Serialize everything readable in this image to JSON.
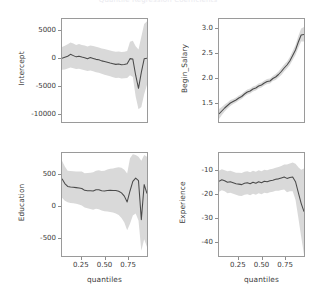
{
  "figure": {
    "title": "Quantile Regression Coefficients",
    "width": 316,
    "height": 295,
    "background": "#ffffff",
    "line_color": "#4a4a4a",
    "band_color": "#d9d9d9",
    "frame_color": "#9a9a9a",
    "text_color": "#3b3b3b"
  },
  "axis": {
    "xlabel": "quantiles",
    "xticks": [
      "0.25",
      "0.50",
      "0.75"
    ]
  },
  "chart_data": [
    {
      "type": "line",
      "id": "intercept",
      "title": "",
      "xlabel": "",
      "ylabel": "Intercept",
      "grid": false,
      "legend": "none",
      "xlim": [
        0.05,
        0.95
      ],
      "ylim": [
        -11500,
        7000
      ],
      "yticks": [
        5000,
        0,
        -5000,
        -10000
      ],
      "ytick_labels": [
        "5000",
        "0",
        "-5000",
        "-10000"
      ],
      "xticks": [
        0.25,
        0.5,
        0.75
      ],
      "xtick_labels": [
        "0.25",
        "0.50",
        "0.75"
      ],
      "x": [
        0.05,
        0.08,
        0.11,
        0.14,
        0.17,
        0.2,
        0.23,
        0.26,
        0.29,
        0.32,
        0.35,
        0.38,
        0.41,
        0.44,
        0.47,
        0.5,
        0.53,
        0.56,
        0.59,
        0.62,
        0.65,
        0.68,
        0.71,
        0.74,
        0.77,
        0.8,
        0.83,
        0.86,
        0.89,
        0.92,
        0.95
      ],
      "series": [
        {
          "name": "coefficient",
          "values": [
            -50,
            120,
            300,
            650,
            420,
            200,
            330,
            180,
            60,
            -120,
            80,
            -80,
            -250,
            -320,
            -520,
            -640,
            -760,
            -900,
            -1020,
            -1150,
            -1080,
            -1220,
            -1160,
            -1050,
            -120,
            -200,
            -3100,
            -5450,
            -2600,
            -150,
            -60
          ]
        },
        {
          "name": "ci_lower",
          "values": [
            -2100,
            -2050,
            -1900,
            -1700,
            -1850,
            -2000,
            -1950,
            -2050,
            -2200,
            -2350,
            -2250,
            -2400,
            -2550,
            -2650,
            -2850,
            -3000,
            -3150,
            -3300,
            -3450,
            -3600,
            -3550,
            -3700,
            -3650,
            -3600,
            -3100,
            -3400,
            -6900,
            -9200,
            -8800,
            -6500,
            -4800
          ]
        },
        {
          "name": "ci_upper",
          "values": [
            1950,
            2200,
            2450,
            2800,
            2600,
            2350,
            2500,
            2350,
            2250,
            2050,
            2250,
            2150,
            2000,
            1900,
            1720,
            1600,
            1480,
            1340,
            1220,
            1100,
            1180,
            1060,
            1120,
            1250,
            2900,
            3100,
            2100,
            1500,
            3800,
            6100,
            6600
          ]
        }
      ]
    },
    {
      "type": "line",
      "id": "begin_salary",
      "title": "",
      "xlabel": "",
      "ylabel": "Begin_Salary",
      "grid": false,
      "legend": "none",
      "xlim": [
        0.05,
        0.95
      ],
      "ylim": [
        1.12,
        3.18
      ],
      "yticks": [
        3.0,
        2.5,
        2.0,
        1.5
      ],
      "ytick_labels": [
        "3.0",
        "2.5",
        "2.0",
        "1.5"
      ],
      "xticks": [
        0.25,
        0.5,
        0.75
      ],
      "xtick_labels": [
        "0.25",
        "0.50",
        "0.75"
      ],
      "x": [
        0.05,
        0.08,
        0.11,
        0.14,
        0.17,
        0.2,
        0.23,
        0.26,
        0.29,
        0.32,
        0.35,
        0.38,
        0.41,
        0.44,
        0.47,
        0.5,
        0.53,
        0.56,
        0.59,
        0.62,
        0.65,
        0.68,
        0.71,
        0.74,
        0.77,
        0.8,
        0.83,
        0.86,
        0.89,
        0.92,
        0.95
      ],
      "series": [
        {
          "name": "coefficient",
          "values": [
            1.28,
            1.34,
            1.4,
            1.45,
            1.5,
            1.53,
            1.56,
            1.6,
            1.63,
            1.68,
            1.72,
            1.74,
            1.78,
            1.8,
            1.84,
            1.86,
            1.9,
            1.93,
            1.94,
            1.99,
            2.02,
            2.07,
            2.13,
            2.2,
            2.26,
            2.34,
            2.45,
            2.56,
            2.72,
            2.86,
            2.87
          ]
        },
        {
          "name": "ci_lower",
          "values": [
            1.18,
            1.26,
            1.33,
            1.39,
            1.44,
            1.48,
            1.51,
            1.55,
            1.58,
            1.63,
            1.67,
            1.69,
            1.73,
            1.75,
            1.79,
            1.81,
            1.85,
            1.88,
            1.89,
            1.94,
            1.96,
            2.01,
            2.06,
            2.13,
            2.19,
            2.26,
            2.36,
            2.46,
            2.6,
            2.73,
            2.73
          ]
        },
        {
          "name": "ci_upper",
          "values": [
            1.38,
            1.42,
            1.47,
            1.51,
            1.56,
            1.58,
            1.61,
            1.65,
            1.68,
            1.73,
            1.77,
            1.79,
            1.83,
            1.85,
            1.89,
            1.91,
            1.95,
            1.98,
            1.99,
            2.04,
            2.08,
            2.13,
            2.2,
            2.27,
            2.33,
            2.42,
            2.54,
            2.66,
            2.84,
            2.99,
            3.02
          ]
        }
      ]
    },
    {
      "type": "line",
      "id": "education",
      "title": "",
      "xlabel": "quantiles",
      "ylabel": "Education",
      "grid": false,
      "legend": "none",
      "xlim": [
        0.05,
        0.95
      ],
      "ylim": [
        -780,
        820
      ],
      "yticks": [
        500,
        0,
        -500
      ],
      "ytick_labels": [
        "500",
        "0",
        "-500"
      ],
      "xticks": [
        0.25,
        0.5,
        0.75
      ],
      "xtick_labels": [
        "0.25",
        "0.50",
        "0.75"
      ],
      "x": [
        0.05,
        0.08,
        0.11,
        0.14,
        0.17,
        0.2,
        0.23,
        0.26,
        0.29,
        0.32,
        0.35,
        0.38,
        0.41,
        0.44,
        0.47,
        0.5,
        0.53,
        0.56,
        0.59,
        0.62,
        0.65,
        0.68,
        0.71,
        0.74,
        0.77,
        0.8,
        0.83,
        0.86,
        0.89,
        0.92,
        0.95
      ],
      "series": [
        {
          "name": "coefficient",
          "values": [
            420,
            345,
            300,
            292,
            288,
            282,
            276,
            268,
            240,
            235,
            232,
            230,
            250,
            248,
            232,
            230,
            236,
            240,
            238,
            236,
            226,
            200,
            150,
            60,
            230,
            380,
            430,
            390,
            -215,
            330,
            190
          ]
        },
        {
          "name": "ci_lower",
          "values": [
            125,
            80,
            55,
            45,
            40,
            30,
            20,
            5,
            -25,
            -40,
            -50,
            -60,
            -45,
            -55,
            -75,
            -85,
            -90,
            -95,
            -105,
            -120,
            -145,
            -190,
            -260,
            -380,
            -280,
            -150,
            -120,
            -230,
            -700,
            -520,
            -640
          ]
        },
        {
          "name": "ci_upper",
          "values": [
            700,
            610,
            545,
            540,
            536,
            534,
            532,
            531,
            505,
            510,
            514,
            520,
            545,
            551,
            539,
            545,
            562,
            575,
            581,
            592,
            597,
            590,
            560,
            500,
            740,
            800,
            790,
            760,
            700,
            790,
            760
          ]
        }
      ]
    },
    {
      "type": "line",
      "id": "experience",
      "title": "",
      "xlabel": "quantiles",
      "ylabel": "Experience",
      "grid": false,
      "legend": "none",
      "xlim": [
        0.05,
        0.95
      ],
      "ylim": [
        -46,
        -3
      ],
      "yticks": [
        -10,
        -20,
        -30,
        -40
      ],
      "ytick_labels": [
        "-10",
        "-20",
        "-30",
        "-40"
      ],
      "xticks": [
        0.25,
        0.5,
        0.75
      ],
      "xtick_labels": [
        "0.25",
        "0.50",
        "0.75"
      ],
      "x": [
        0.05,
        0.08,
        0.11,
        0.14,
        0.17,
        0.2,
        0.23,
        0.26,
        0.29,
        0.32,
        0.35,
        0.38,
        0.41,
        0.44,
        0.47,
        0.5,
        0.53,
        0.56,
        0.59,
        0.62,
        0.65,
        0.68,
        0.71,
        0.74,
        0.77,
        0.8,
        0.83,
        0.86,
        0.89,
        0.92,
        0.95
      ],
      "series": [
        {
          "name": "coefficient",
          "values": [
            -14.8,
            -14.2,
            -14.6,
            -15.2,
            -15.0,
            -15.4,
            -15.8,
            -16.0,
            -16.2,
            -15.6,
            -15.4,
            -15.8,
            -15.2,
            -15.6,
            -15.0,
            -15.4,
            -14.8,
            -15.0,
            -14.6,
            -14.4,
            -14.0,
            -13.8,
            -13.4,
            -13.0,
            -13.6,
            -13.2,
            -13.0,
            -15.0,
            -19.5,
            -24.0,
            -27.5
          ]
        },
        {
          "name": "ci_lower",
          "values": [
            -19.2,
            -18.6,
            -19.0,
            -19.8,
            -19.6,
            -20.0,
            -20.4,
            -20.8,
            -21.0,
            -20.4,
            -20.2,
            -20.6,
            -20.0,
            -20.4,
            -19.8,
            -20.2,
            -19.6,
            -19.8,
            -19.4,
            -19.2,
            -18.8,
            -18.8,
            -18.4,
            -18.2,
            -19.4,
            -19.0,
            -19.0,
            -22.5,
            -30.0,
            -38.0,
            -45.5
          ]
        },
        {
          "name": "ci_upper",
          "values": [
            -10.4,
            -9.8,
            -10.2,
            -10.6,
            -10.4,
            -10.8,
            -11.2,
            -11.2,
            -11.4,
            -10.8,
            -10.6,
            -11.0,
            -10.4,
            -10.8,
            -10.2,
            -10.6,
            -10.0,
            -10.2,
            -9.8,
            -9.6,
            -9.2,
            -8.8,
            -8.4,
            -7.8,
            -7.8,
            -7.4,
            -7.0,
            -7.5,
            -9.0,
            -10.0,
            -9.5
          ]
        }
      ]
    }
  ]
}
